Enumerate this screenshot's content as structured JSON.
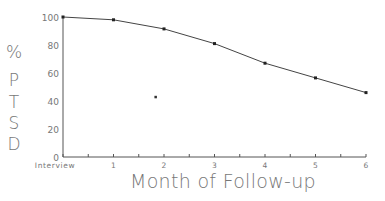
{
  "chart_data": {
    "type": "line",
    "title": "",
    "xlabel": "Month of Follow-up",
    "ylabel": "% PTSD",
    "ylabel_letters": [
      "%",
      "P",
      "T",
      "S",
      "D"
    ],
    "categories": [
      "Interview",
      "1",
      "2",
      "3",
      "4",
      "5",
      "6"
    ],
    "x_ticks": [
      "Interview",
      "1",
      "2",
      "3",
      "4",
      "5",
      "6"
    ],
    "y_ticks": [
      "0",
      "20",
      "40",
      "60",
      "80",
      "100"
    ],
    "ylim": [
      0,
      100
    ],
    "grid": false,
    "legend": null,
    "series": [
      {
        "name": "% PTSD",
        "values": [
          100,
          98,
          91.5,
          81,
          67,
          56.5,
          46
        ]
      }
    ],
    "annotations": [
      {
        "type": "stray-dot",
        "x": 1.83,
        "y": 43
      }
    ],
    "colors": {
      "line": "#444444",
      "axis": "#555555",
      "text": "#777777"
    }
  }
}
